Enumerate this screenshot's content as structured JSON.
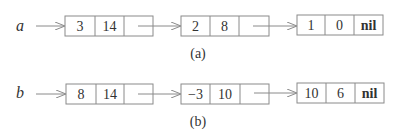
{
  "diagram": {
    "type": "linked-lists",
    "lists": [
      {
        "variable": "a",
        "caption": "(a)",
        "nodes": [
          {
            "fields": [
              "3",
              "14",
              ""
            ]
          },
          {
            "fields": [
              "2",
              "8",
              ""
            ]
          },
          {
            "fields": [
              "1",
              "0",
              "nil"
            ]
          }
        ]
      },
      {
        "variable": "b",
        "caption": "(b)",
        "nodes": [
          {
            "fields": [
              "8",
              "14",
              ""
            ]
          },
          {
            "fields": [
              "-3",
              "10",
              ""
            ]
          },
          {
            "fields": [
              "10",
              "6",
              "nil"
            ]
          }
        ]
      }
    ]
  },
  "colors": {
    "box_stroke": "#8a8a8a",
    "arrow": "#8a8a8a",
    "text": "#333333"
  }
}
